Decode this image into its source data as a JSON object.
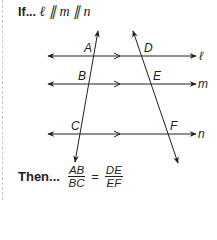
{
  "condition": {
    "prefix": "If...",
    "statement": "ℓ ∥ m ∥ n"
  },
  "diagram": {
    "parallel_lines": [
      {
        "label": "ℓ",
        "y": 56
      },
      {
        "label": "m",
        "y": 84
      },
      {
        "label": "n",
        "y": 134
      }
    ],
    "transversals": [
      {
        "points": [
          "A",
          "B",
          "C"
        ]
      },
      {
        "points": [
          "D",
          "E",
          "F"
        ]
      }
    ],
    "point_labels": {
      "A": "A",
      "B": "B",
      "C": "C",
      "D": "D",
      "E": "E",
      "F": "F"
    },
    "stroke_color": "#231f20"
  },
  "conclusion": {
    "prefix": "Then...",
    "left_fraction": {
      "numerator": "AB",
      "denominator": "BC"
    },
    "equals": "=",
    "right_fraction": {
      "numerator": "DE",
      "denominator": "EF"
    }
  }
}
